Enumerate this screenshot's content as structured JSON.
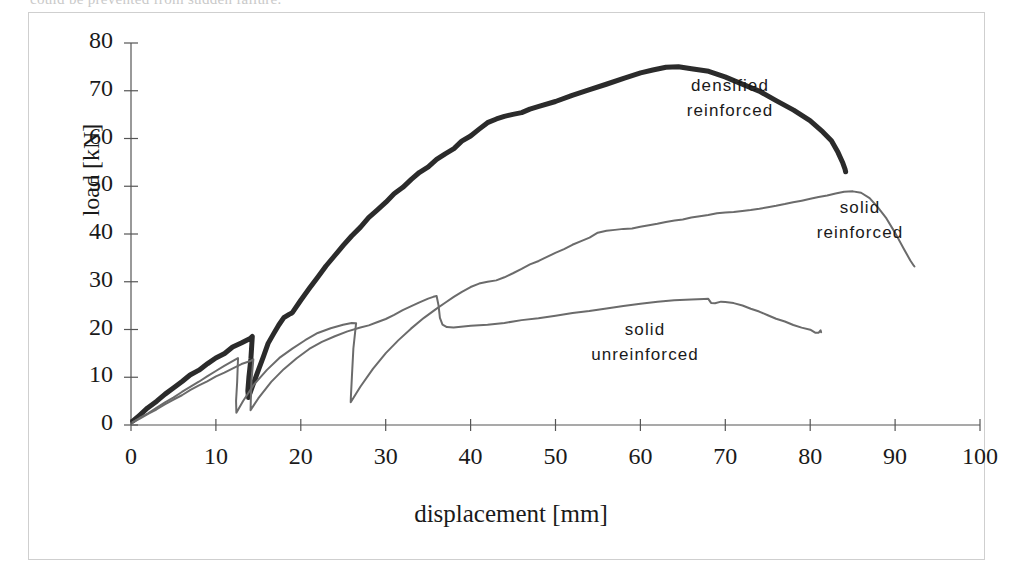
{
  "figure": {
    "cut_off_top_text": "could be prevented from sudden failure.",
    "frame_border_color": "#cfcfcf",
    "background": "#ffffff"
  },
  "axes": {
    "xlabel": "displacement [mm]",
    "ylabel": "load [kN]",
    "xticks": [
      0,
      10,
      20,
      30,
      40,
      50,
      60,
      70,
      80,
      90,
      100
    ],
    "yticks": [
      0,
      10,
      20,
      30,
      40,
      50,
      60,
      70,
      80
    ],
    "xlim": [
      0,
      100
    ],
    "ylim": [
      0,
      80
    ],
    "axis_color": "#555555"
  },
  "annotations": [
    {
      "name": "densified-reinforced",
      "line1": "densified",
      "line2": "reinforced",
      "x": 730,
      "y": 74
    },
    {
      "name": "solid-reinforced",
      "line1": "solid",
      "line2": "reinforced",
      "x": 860,
      "y": 196
    },
    {
      "name": "solid-unreinforced",
      "line1": "solid",
      "line2": "unreinforced",
      "x": 645,
      "y": 318
    }
  ],
  "chart_data": {
    "type": "line",
    "title": "",
    "xlabel": "displacement [mm]",
    "ylabel": "load [kN]",
    "xlim": [
      0,
      100
    ],
    "ylim": [
      0,
      80
    ],
    "grid": false,
    "legend": "inline-annotations",
    "series": [
      {
        "name": "densified reinforced",
        "color": "#2b2b2b",
        "width": 5,
        "peak": {
          "x": 63.5,
          "y": 75.0
        },
        "end": {
          "x": 84.2,
          "y": 53.0
        },
        "points": [
          [
            0.2,
            0.8
          ],
          [
            1.0,
            2.0
          ],
          [
            2.0,
            3.6
          ],
          [
            3.0,
            5.0
          ],
          [
            4.0,
            6.4
          ],
          [
            5.0,
            7.8
          ],
          [
            6.0,
            9.1
          ],
          [
            7.0,
            10.4
          ],
          [
            8.0,
            11.6
          ],
          [
            9.0,
            12.8
          ],
          [
            10.0,
            14.0
          ],
          [
            11.0,
            15.1
          ],
          [
            12.0,
            16.2
          ],
          [
            13.0,
            17.2
          ],
          [
            14.0,
            18.2
          ],
          [
            14.3,
            18.4
          ],
          [
            14.1,
            14.0
          ],
          [
            13.9,
            10.0
          ],
          [
            13.8,
            7.0
          ],
          [
            13.8,
            5.9
          ],
          [
            14.3,
            8.0
          ],
          [
            15.0,
            11.5
          ],
          [
            15.6,
            14.5
          ],
          [
            16.2,
            17.0
          ],
          [
            16.8,
            19.2
          ],
          [
            17.4,
            21.0
          ],
          [
            18.0,
            22.4
          ],
          [
            18.6,
            23.2
          ],
          [
            19.0,
            23.5
          ],
          [
            19.0,
            23.5
          ],
          [
            20.0,
            26.2
          ],
          [
            21.0,
            28.6
          ],
          [
            22.0,
            31.0
          ],
          [
            23.0,
            33.3
          ],
          [
            24.0,
            35.5
          ],
          [
            25.0,
            37.6
          ],
          [
            26.0,
            39.6
          ],
          [
            27.0,
            41.5
          ],
          [
            28.0,
            43.3
          ],
          [
            29.0,
            45.0
          ],
          [
            30.0,
            46.7
          ],
          [
            31.0,
            48.3
          ],
          [
            32.0,
            49.9
          ],
          [
            33.0,
            51.4
          ],
          [
            34.0,
            52.8
          ],
          [
            35.0,
            54.2
          ],
          [
            36.0,
            55.5
          ],
          [
            37.0,
            56.8
          ],
          [
            38.0,
            58.0
          ],
          [
            39.0,
            59.3
          ],
          [
            40.0,
            60.6
          ],
          [
            41.0,
            62.0
          ],
          [
            42.0,
            63.2
          ],
          [
            43.0,
            64.2
          ],
          [
            44.0,
            64.6
          ],
          [
            45.0,
            65.0
          ],
          [
            46.0,
            65.5
          ],
          [
            47.0,
            66.1
          ],
          [
            48.0,
            66.7
          ],
          [
            50.0,
            67.8
          ],
          [
            52.0,
            69.0
          ],
          [
            54.0,
            70.2
          ],
          [
            56.0,
            71.4
          ],
          [
            58.0,
            72.6
          ],
          [
            60.0,
            73.7
          ],
          [
            61.5,
            74.4
          ],
          [
            63.0,
            74.9
          ],
          [
            64.5,
            75.0
          ],
          [
            66.0,
            74.7
          ],
          [
            68.0,
            74.0
          ],
          [
            70.0,
            72.9
          ],
          [
            72.0,
            71.5
          ],
          [
            74.0,
            69.8
          ],
          [
            76.0,
            68.0
          ],
          [
            78.0,
            66.0
          ],
          [
            80.0,
            63.6
          ],
          [
            81.5,
            61.5
          ],
          [
            82.5,
            59.5
          ],
          [
            83.3,
            57.0
          ],
          [
            83.8,
            55.0
          ],
          [
            84.1,
            53.5
          ],
          [
            84.2,
            53.0
          ]
        ],
        "cycles": [
          {
            "unload_from": [
              14.3,
              18.4
            ],
            "unload_to": [
              13.8,
              5.9
            ]
          },
          {
            "unload_from": [
              19.0,
              23.5
            ],
            "unload_to": [
              18.6,
              6.2
            ]
          }
        ]
      },
      {
        "name": "solid reinforced",
        "color": "#6b6b6b",
        "width": 2,
        "peak": {
          "x": 85.0,
          "y": 49.0
        },
        "end": {
          "x": 92.3,
          "y": 33.2
        },
        "points": [
          [
            0.2,
            0.6
          ],
          [
            1.0,
            1.4
          ],
          [
            2.0,
            2.5
          ],
          [
            3.0,
            3.6
          ],
          [
            4.0,
            4.7
          ],
          [
            5.0,
            5.8
          ],
          [
            6.0,
            6.9
          ],
          [
            7.0,
            8.0
          ],
          [
            8.0,
            9.1
          ],
          [
            9.0,
            10.2
          ],
          [
            10.0,
            11.3
          ],
          [
            11.0,
            12.4
          ],
          [
            12.0,
            13.4
          ],
          [
            12.6,
            14.0
          ],
          [
            12.6,
            14.0
          ],
          [
            12.5,
            9.0
          ],
          [
            12.4,
            5.0
          ],
          [
            12.4,
            2.6
          ],
          [
            13.2,
            5.0
          ],
          [
            14.5,
            8.5
          ],
          [
            16.0,
            11.6
          ],
          [
            17.5,
            14.0
          ],
          [
            19.0,
            16.0
          ],
          [
            20.5,
            17.8
          ],
          [
            22.0,
            19.2
          ],
          [
            23.5,
            20.3
          ],
          [
            25.0,
            21.0
          ],
          [
            26.0,
            21.3
          ],
          [
            26.5,
            21.4
          ],
          [
            26.2,
            16.0
          ],
          [
            26.0,
            10.0
          ],
          [
            25.9,
            5.8
          ],
          [
            25.9,
            4.7
          ],
          [
            27.0,
            8.0
          ],
          [
            28.5,
            11.8
          ],
          [
            30.0,
            15.0
          ],
          [
            31.5,
            17.8
          ],
          [
            33.0,
            20.2
          ],
          [
            34.5,
            22.4
          ],
          [
            36.0,
            24.4
          ],
          [
            37.0,
            25.6
          ],
          [
            38.0,
            26.8
          ],
          [
            39.0,
            27.9
          ],
          [
            40.0,
            28.9
          ],
          [
            41.0,
            29.6
          ],
          [
            42.0,
            30.0
          ],
          [
            43.0,
            30.3
          ],
          [
            44.0,
            30.9
          ],
          [
            45.0,
            31.8
          ],
          [
            46.0,
            32.7
          ],
          [
            47.0,
            33.6
          ],
          [
            48.0,
            34.4
          ],
          [
            49.0,
            35.2
          ],
          [
            50.0,
            36.0
          ],
          [
            51.0,
            36.9
          ],
          [
            52.0,
            37.7
          ],
          [
            53.0,
            38.5
          ],
          [
            54.0,
            39.3
          ],
          [
            55.0,
            40.2
          ],
          [
            56.0,
            40.7
          ],
          [
            57.0,
            40.9
          ],
          [
            58.0,
            41.0
          ],
          [
            59.0,
            41.2
          ],
          [
            60.0,
            41.5
          ],
          [
            61.0,
            41.8
          ],
          [
            62.0,
            42.2
          ],
          [
            63.0,
            42.5
          ],
          [
            64.0,
            42.8
          ],
          [
            65.0,
            43.1
          ],
          [
            66.0,
            43.4
          ],
          [
            67.0,
            43.7
          ],
          [
            68.0,
            44.0
          ],
          [
            69.0,
            44.3
          ],
          [
            70.0,
            44.5
          ],
          [
            71.0,
            44.6
          ],
          [
            72.0,
            44.8
          ],
          [
            73.0,
            45.0
          ],
          [
            74.0,
            45.3
          ],
          [
            75.0,
            45.6
          ],
          [
            76.0,
            45.9
          ],
          [
            77.0,
            46.3
          ],
          [
            78.0,
            46.6
          ],
          [
            79.0,
            47.0
          ],
          [
            80.0,
            47.4
          ],
          [
            81.0,
            47.7
          ],
          [
            82.0,
            48.1
          ],
          [
            83.0,
            48.5
          ],
          [
            84.0,
            48.8
          ],
          [
            85.0,
            49.0
          ],
          [
            86.0,
            48.6
          ],
          [
            87.0,
            47.5
          ],
          [
            88.0,
            45.6
          ],
          [
            89.0,
            43.2
          ],
          [
            90.0,
            40.2
          ],
          [
            91.0,
            37.0
          ],
          [
            91.8,
            34.4
          ],
          [
            92.2,
            33.4
          ],
          [
            92.3,
            33.2
          ]
        ],
        "cycles": [
          {
            "unload_from": [
              12.6,
              14.0
            ],
            "unload_to": [
              12.4,
              2.6
            ]
          },
          {
            "unload_from": [
              26.5,
              21.4
            ],
            "unload_to": [
              25.9,
              4.7
            ]
          }
        ]
      },
      {
        "name": "solid unreinforced",
        "color": "#6b6b6b",
        "width": 2,
        "peak": {
          "x": 36.0,
          "y": 27.0
        },
        "second_peak": {
          "x": 68.0,
          "y": 26.4
        },
        "drop_to": {
          "x": 37.0,
          "y": 20.5
        },
        "end": {
          "x": 81.2,
          "y": 19.5
        },
        "points": [
          [
            0.2,
            0.6
          ],
          [
            1.0,
            1.3
          ],
          [
            2.0,
            2.3
          ],
          [
            3.0,
            3.3
          ],
          [
            4.0,
            4.3
          ],
          [
            5.0,
            5.3
          ],
          [
            6.0,
            6.3
          ],
          [
            7.0,
            7.3
          ],
          [
            8.0,
            8.3
          ],
          [
            9.0,
            9.2
          ],
          [
            10.0,
            10.1
          ],
          [
            11.0,
            11.0
          ],
          [
            12.0,
            11.9
          ],
          [
            13.0,
            12.7
          ],
          [
            14.0,
            13.4
          ],
          [
            14.4,
            13.7
          ],
          [
            14.4,
            13.7
          ],
          [
            14.2,
            9.5
          ],
          [
            14.1,
            5.5
          ],
          [
            14.1,
            3.1
          ],
          [
            15.0,
            5.6
          ],
          [
            16.5,
            9.0
          ],
          [
            18.0,
            11.7
          ],
          [
            19.5,
            14.0
          ],
          [
            21.0,
            15.9
          ],
          [
            22.5,
            17.4
          ],
          [
            24.0,
            18.6
          ],
          [
            25.5,
            19.6
          ],
          [
            27.0,
            20.4
          ],
          [
            28.0,
            20.9
          ],
          [
            29.0,
            21.5
          ],
          [
            30.0,
            22.2
          ],
          [
            31.0,
            23.1
          ],
          [
            32.0,
            24.0
          ],
          [
            33.0,
            24.9
          ],
          [
            34.0,
            25.7
          ],
          [
            35.0,
            26.4
          ],
          [
            35.6,
            26.9
          ],
          [
            36.0,
            27.0
          ],
          [
            36.2,
            25.0
          ],
          [
            36.4,
            22.5
          ],
          [
            36.7,
            21.0
          ],
          [
            37.2,
            20.5
          ],
          [
            38.0,
            20.5
          ],
          [
            40.0,
            20.7
          ],
          [
            42.0,
            21.0
          ],
          [
            44.0,
            21.4
          ],
          [
            46.0,
            21.9
          ],
          [
            48.0,
            22.4
          ],
          [
            50.0,
            22.9
          ],
          [
            52.0,
            23.4
          ],
          [
            54.0,
            23.9
          ],
          [
            56.0,
            24.4
          ],
          [
            58.0,
            24.9
          ],
          [
            60.0,
            25.4
          ],
          [
            62.0,
            25.8
          ],
          [
            64.0,
            26.1
          ],
          [
            66.0,
            26.3
          ],
          [
            67.5,
            26.4
          ],
          [
            68.0,
            26.4
          ],
          [
            68.3,
            25.6
          ],
          [
            68.8,
            25.5
          ],
          [
            69.5,
            25.8
          ],
          [
            70.0,
            25.8
          ],
          [
            71.0,
            25.5
          ],
          [
            72.0,
            25.0
          ],
          [
            73.0,
            24.4
          ],
          [
            74.0,
            23.7
          ],
          [
            75.0,
            23.0
          ],
          [
            76.0,
            22.3
          ],
          [
            77.0,
            21.6
          ],
          [
            78.0,
            21.0
          ],
          [
            79.0,
            20.4
          ],
          [
            80.0,
            19.9
          ],
          [
            80.6,
            19.4
          ],
          [
            81.0,
            19.3
          ],
          [
            81.2,
            19.8
          ],
          [
            81.3,
            19.5
          ]
        ],
        "cycles": [
          {
            "unload_from": [
              14.4,
              13.7
            ],
            "unload_to": [
              14.1,
              3.1
            ]
          }
        ]
      }
    ]
  }
}
